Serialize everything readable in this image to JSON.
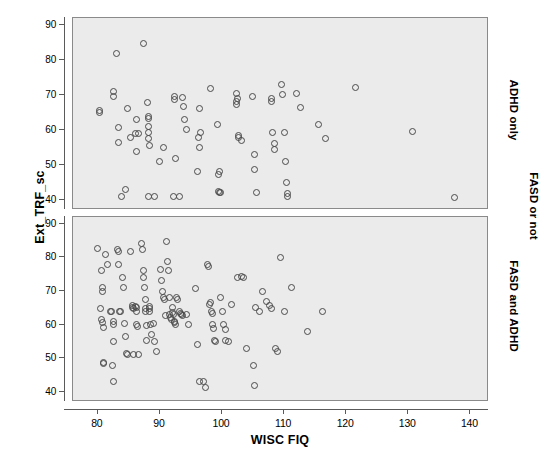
{
  "chart_data": {
    "type": "scatter",
    "title": "",
    "xlabel": "WISC FIQ",
    "ylabel": "Ext_TRF_sc",
    "panel_group_label": "FASD or not",
    "xlim": [
      76,
      143
    ],
    "ylim": [
      37,
      92
    ],
    "xticks": [
      80,
      90,
      100,
      110,
      120,
      130,
      140
    ],
    "yticks": [
      40,
      50,
      60,
      70,
      80,
      90
    ],
    "grid": false,
    "legend": "none",
    "marker": "open-circle",
    "marker_color": "#4a4a4a",
    "panel_background": "#ebebeb",
    "panels": [
      {
        "strip_label": "ADHD only",
        "position": "top",
        "points": [
          [
            80.2,
            65.6
          ],
          [
            80.3,
            65.0
          ],
          [
            82.6,
            70.9
          ],
          [
            82.6,
            69.4
          ],
          [
            83.0,
            81.9
          ],
          [
            83.4,
            60.7
          ],
          [
            83.3,
            56.2
          ],
          [
            83.8,
            41.0
          ],
          [
            84.5,
            42.9
          ],
          [
            84.8,
            66.1
          ],
          [
            85.3,
            57.8
          ],
          [
            86.1,
            58.8
          ],
          [
            86.3,
            63.0
          ],
          [
            86.2,
            53.9
          ],
          [
            86.5,
            59.0
          ],
          [
            87.3,
            84.8
          ],
          [
            88.0,
            67.9
          ],
          [
            88.1,
            63.8
          ],
          [
            88.1,
            63.1
          ],
          [
            88.1,
            61.0
          ],
          [
            88.2,
            59.3
          ],
          [
            88.2,
            57.4
          ],
          [
            88.3,
            55.5
          ],
          [
            88.2,
            41.0
          ],
          [
            89.2,
            41.0
          ],
          [
            90.0,
            50.9
          ],
          [
            90.5,
            55.0
          ],
          [
            92.3,
            69.4
          ],
          [
            92.3,
            68.6
          ],
          [
            92.5,
            51.8
          ],
          [
            92.2,
            41.0
          ],
          [
            93.1,
            41.0
          ],
          [
            93.6,
            69.2
          ],
          [
            93.8,
            66.7
          ],
          [
            94.0,
            62.9
          ],
          [
            94.3,
            60.0
          ],
          [
            96.3,
            66.0
          ],
          [
            96.5,
            59.2
          ],
          [
            96.2,
            57.8
          ],
          [
            96.4,
            55.0
          ],
          [
            96.1,
            47.9
          ],
          [
            98.2,
            71.9
          ],
          [
            99.2,
            61.6
          ],
          [
            99.4,
            47.1
          ],
          [
            99.6,
            48.0
          ],
          [
            99.5,
            42.3
          ],
          [
            99.6,
            41.9
          ],
          [
            99.8,
            41.9
          ],
          [
            102.3,
            70.3
          ],
          [
            102.5,
            68.8
          ],
          [
            102.4,
            68.1
          ],
          [
            102.4,
            67.2
          ],
          [
            102.6,
            58.2
          ],
          [
            102.6,
            57.9
          ],
          [
            103.1,
            57.0
          ],
          [
            104.9,
            69.6
          ],
          [
            105.3,
            53.0
          ],
          [
            105.2,
            48.6
          ],
          [
            105.5,
            41.9
          ],
          [
            107.9,
            68.8
          ],
          [
            108.0,
            68.0
          ],
          [
            108.2,
            59.3
          ],
          [
            108.4,
            56.0
          ],
          [
            108.5,
            54.3
          ],
          [
            109.5,
            73.0
          ],
          [
            109.8,
            70.2
          ],
          [
            110.0,
            59.2
          ],
          [
            110.2,
            50.8
          ],
          [
            110.4,
            45.0
          ],
          [
            110.5,
            41.6
          ],
          [
            110.6,
            41.0
          ],
          [
            112.0,
            70.4
          ],
          [
            112.6,
            66.5
          ],
          [
            115.5,
            61.4
          ],
          [
            116.6,
            57.6
          ],
          [
            121.5,
            72.0
          ],
          [
            130.6,
            59.6
          ],
          [
            137.5,
            40.5
          ]
        ]
      },
      {
        "strip_label": "FASD and ADHD",
        "position": "bottom",
        "points": [
          [
            79.9,
            82.7
          ],
          [
            80.6,
            76.1
          ],
          [
            80.8,
            70.9
          ],
          [
            80.8,
            70.0
          ],
          [
            80.5,
            64.8
          ],
          [
            80.6,
            61.5
          ],
          [
            80.8,
            60.5
          ],
          [
            80.9,
            59.2
          ],
          [
            80.9,
            48.8
          ],
          [
            80.9,
            48.3
          ],
          [
            81.3,
            80.8
          ],
          [
            81.5,
            78.0
          ],
          [
            82.0,
            64.0
          ],
          [
            82.2,
            63.9
          ],
          [
            82.5,
            55.0
          ],
          [
            82.6,
            60.9
          ],
          [
            82.6,
            60.0
          ],
          [
            82.3,
            48.0
          ],
          [
            82.5,
            43.0
          ],
          [
            83.2,
            82.4
          ],
          [
            83.3,
            81.7
          ],
          [
            83.4,
            78.0
          ],
          [
            83.5,
            63.9
          ],
          [
            83.7,
            63.8
          ],
          [
            84.0,
            74.0
          ],
          [
            84.1,
            71.0
          ],
          [
            84.3,
            60.4
          ],
          [
            84.5,
            56.4
          ],
          [
            84.6,
            51.4
          ],
          [
            84.8,
            51.1
          ],
          [
            85.3,
            81.6
          ],
          [
            85.6,
            65.7
          ],
          [
            85.6,
            65.1
          ],
          [
            85.7,
            64.7
          ],
          [
            85.8,
            51.0
          ],
          [
            86.0,
            65.4
          ],
          [
            86.2,
            65.0
          ],
          [
            86.3,
            64.0
          ],
          [
            86.3,
            60.0
          ],
          [
            86.4,
            59.5
          ],
          [
            86.6,
            51.2
          ],
          [
            87.1,
            84.0
          ],
          [
            87.2,
            82.4
          ],
          [
            87.3,
            76.0
          ],
          [
            87.4,
            73.9
          ],
          [
            87.5,
            71.0
          ],
          [
            87.6,
            67.5
          ],
          [
            87.6,
            64.7
          ],
          [
            87.7,
            64.0
          ],
          [
            87.8,
            59.6
          ],
          [
            87.9,
            55.3
          ],
          [
            88.3,
            65.3
          ],
          [
            88.4,
            64.9
          ],
          [
            88.4,
            64.0
          ],
          [
            88.5,
            60.1
          ],
          [
            88.6,
            57.0
          ],
          [
            89.0,
            60.3
          ],
          [
            89.2,
            54.9
          ],
          [
            89.4,
            52.0
          ],
          [
            90.1,
            76.5
          ],
          [
            90.3,
            73.0
          ],
          [
            90.4,
            70.0
          ],
          [
            90.5,
            68.1
          ],
          [
            90.7,
            67.6
          ],
          [
            90.9,
            62.8
          ],
          [
            91.0,
            84.8
          ],
          [
            91.2,
            78.8
          ],
          [
            91.4,
            76.2
          ],
          [
            91.5,
            68.2
          ],
          [
            91.6,
            63.0
          ],
          [
            91.7,
            62.1
          ],
          [
            91.8,
            61.6
          ],
          [
            92.0,
            65.0
          ],
          [
            92.1,
            63.5
          ],
          [
            92.2,
            62.9
          ],
          [
            92.3,
            61.0
          ],
          [
            92.4,
            60.5
          ],
          [
            92.5,
            60.0
          ],
          [
            92.6,
            68.0
          ],
          [
            92.8,
            67.6
          ],
          [
            93.1,
            64.0
          ],
          [
            93.3,
            63.3
          ],
          [
            93.5,
            63.0
          ],
          [
            93.7,
            62.6
          ],
          [
            94.2,
            63.1
          ],
          [
            94.6,
            60.0
          ],
          [
            95.8,
            70.8
          ],
          [
            96.0,
            54.0
          ],
          [
            96.3,
            43.1
          ],
          [
            97.0,
            43.0
          ],
          [
            97.4,
            41.2
          ],
          [
            97.6,
            77.9
          ],
          [
            97.9,
            77.4
          ],
          [
            98.0,
            65.9
          ],
          [
            98.2,
            66.5
          ],
          [
            98.3,
            64.0
          ],
          [
            98.4,
            63.2
          ],
          [
            98.5,
            60.0
          ],
          [
            98.7,
            59.0
          ],
          [
            98.8,
            55.3
          ],
          [
            98.9,
            55.0
          ],
          [
            99.8,
            68.0
          ],
          [
            100.0,
            63.8
          ],
          [
            100.3,
            60.0
          ],
          [
            100.5,
            58.6
          ],
          [
            100.6,
            55.4
          ],
          [
            101.0,
            55.0
          ],
          [
            101.5,
            66.0
          ],
          [
            102.5,
            74.0
          ],
          [
            103.1,
            74.4
          ],
          [
            103.4,
            74.0
          ],
          [
            104.0,
            52.9
          ],
          [
            105.0,
            48.0
          ],
          [
            105.2,
            42.0
          ],
          [
            105.4,
            65.0
          ],
          [
            106.0,
            64.0
          ],
          [
            106.6,
            69.8
          ],
          [
            107.1,
            66.8
          ],
          [
            107.6,
            65.6
          ],
          [
            108.0,
            64.8
          ],
          [
            108.6,
            53.0
          ],
          [
            109.0,
            51.9
          ],
          [
            109.4,
            80.0
          ],
          [
            110.0,
            64.0
          ],
          [
            111.2,
            71.0
          ],
          [
            116.2,
            64.0
          ],
          [
            113.8,
            58.0
          ]
        ]
      }
    ]
  },
  "axis": {
    "ytick_labels": [
      "90",
      "80",
      "70",
      "60",
      "50",
      "40"
    ],
    "xtick_labels": [
      "80",
      "90",
      "100",
      "110",
      "120",
      "130",
      "140"
    ]
  }
}
